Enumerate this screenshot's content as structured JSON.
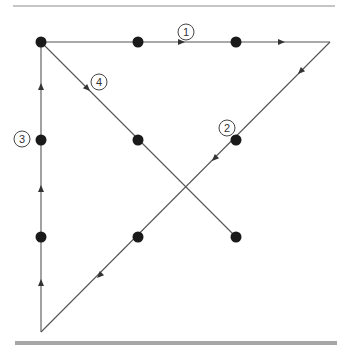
{
  "diagram": {
    "colors": {
      "line": "#555555",
      "dot": "#1a1a1a",
      "top_rule": "#8c8c8c",
      "bottom_rule": "#a6a6a6",
      "label_circle": "#444444",
      "label_text": "#333333"
    },
    "dots": [
      {
        "x": 41,
        "y": 42
      },
      {
        "x": 138,
        "y": 42
      },
      {
        "x": 236,
        "y": 42
      },
      {
        "x": 41,
        "y": 140
      },
      {
        "x": 138,
        "y": 140
      },
      {
        "x": 236,
        "y": 140
      },
      {
        "x": 41,
        "y": 237
      },
      {
        "x": 138,
        "y": 237
      },
      {
        "x": 236,
        "y": 237
      }
    ],
    "segments": [
      {
        "id": "1",
        "from": {
          "x": 41,
          "y": 42
        },
        "to": {
          "x": 330,
          "y": 42
        },
        "direction": "right"
      },
      {
        "id": "2",
        "from": {
          "x": 330,
          "y": 42
        },
        "to": {
          "x": 41,
          "y": 332
        },
        "direction": "down-left"
      },
      {
        "id": "3",
        "from": {
          "x": 41,
          "y": 332
        },
        "to": {
          "x": 41,
          "y": 42
        },
        "direction": "up"
      },
      {
        "id": "4",
        "from": {
          "x": 41,
          "y": 42
        },
        "to": {
          "x": 236,
          "y": 237
        },
        "direction": "down-right"
      }
    ],
    "labels": [
      {
        "text": "1",
        "x": 186,
        "y": 32
      },
      {
        "text": "2",
        "x": 227,
        "y": 128
      },
      {
        "text": "3",
        "x": 22,
        "y": 139
      },
      {
        "text": "4",
        "x": 99,
        "y": 82
      }
    ]
  }
}
